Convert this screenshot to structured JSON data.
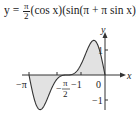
{
  "title": {
    "lhs": "y =",
    "frac_num": "π",
    "frac_den": "2",
    "rhs": "(cos x)(sin(π + π sin x))"
  },
  "chart_data": {
    "type": "line",
    "xlabel": "x",
    "ylabel": "y",
    "x_ticks": [
      "-π",
      "-π/2",
      "-1",
      "0"
    ],
    "y_ticks": [
      "1",
      "-1"
    ],
    "xlim": [
      -3.14159,
      0
    ],
    "ylim": [
      -1.4,
      1.4
    ],
    "grid": false,
    "shaded_regions": "area between curve and x-axis shaded light gray",
    "x": [
      -3.1416,
      -2.9,
      -2.6,
      -2.4,
      -2.2,
      -2.0,
      -1.8,
      -1.5708,
      -1.4,
      -1.2,
      -1.0,
      -0.8,
      -0.6,
      -0.5,
      -0.4,
      -0.2,
      0.0
    ],
    "values": [
      0.0,
      -0.64,
      -1.33,
      -1.26,
      -0.74,
      -0.27,
      -0.05,
      0.0,
      0.01,
      0.07,
      0.41,
      1.02,
      1.33,
      1.32,
      1.14,
      0.56,
      0.0
    ],
    "colors": {
      "line": "#333333",
      "fill": "#e0e0e0",
      "axis": "#333333"
    }
  },
  "axis_labels": {
    "x": "x",
    "y": "y",
    "neg_pi": "−π",
    "neg_pi_over_2_num": "π",
    "neg_pi_over_2_den": "2",
    "neg_one_x": "−1",
    "zero": "0",
    "y_one": "1",
    "y_neg_one": "−1"
  }
}
